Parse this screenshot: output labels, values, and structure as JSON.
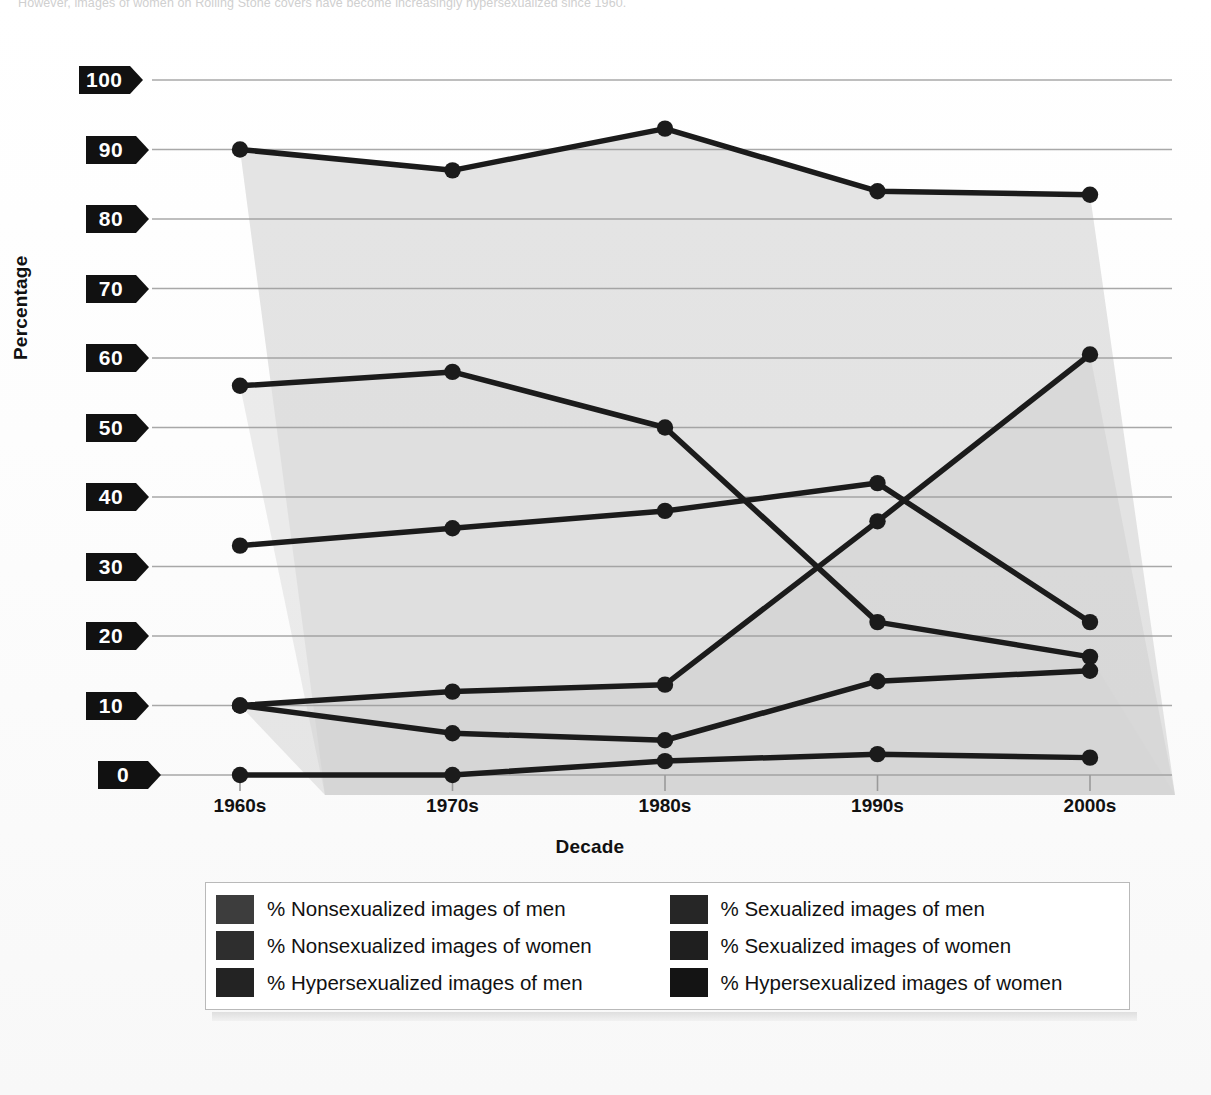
{
  "caption": {
    "text": "However, images of women on Rolling Stone covers have become increasingly hypersexualized since 1960."
  },
  "axis": {
    "ylabel": "Percentage",
    "xlabel": "Decade",
    "yticks": [
      "0",
      "10",
      "20",
      "30",
      "40",
      "50",
      "60",
      "70",
      "80",
      "90",
      "100"
    ],
    "xticks": [
      "1960s",
      "1970s",
      "1980s",
      "1990s",
      "2000s"
    ]
  },
  "colors": {
    "line": "#1b1b1b",
    "marker": "#1b1b1b",
    "grid": "#9a9a9a",
    "tag_bg": "#111111",
    "tag_text": "#ffffff",
    "band_light": "#dcdcdc",
    "band_dark": "#cdcdcd",
    "legend_border": "#b9b9b9",
    "swatch_1": "#3d3d3d",
    "swatch_2": "#2e2e2e",
    "swatch_3": "#232323",
    "swatch_4": "#262626",
    "swatch_5": "#1f1f1f",
    "swatch_6": "#141414"
  },
  "legend": {
    "items": [
      {
        "label": "% Nonsexualized images of men",
        "swatch": "swatch_1",
        "name": "legend-nonsexualized-men"
      },
      {
        "label": "% Sexualized images of men",
        "swatch": "swatch_4",
        "name": "legend-sexualized-men"
      },
      {
        "label": "% Nonsexualized images of women",
        "swatch": "swatch_2",
        "name": "legend-nonsexualized-women"
      },
      {
        "label": "% Sexualized images of women",
        "swatch": "swatch_5",
        "name": "legend-sexualized-women"
      },
      {
        "label": "% Hypersexualized images of men",
        "swatch": "swatch_3",
        "name": "legend-hypersexualized-men"
      },
      {
        "label": "% Hypersexualized images of women",
        "swatch": "swatch_6",
        "name": "legend-hypersexualized-women"
      }
    ]
  },
  "chart_data": {
    "type": "line",
    "title": "",
    "xlabel": "Decade",
    "ylabel": "Percentage",
    "categories": [
      "1960s",
      "1970s",
      "1980s",
      "1990s",
      "2000s"
    ],
    "ylim": [
      0,
      100
    ],
    "ytick_step": 10,
    "grid": true,
    "legend_position": "bottom",
    "markers": "filled-circle",
    "series": [
      {
        "name": "% Nonsexualized images of men",
        "values": [
          90,
          87,
          93,
          84,
          83.5
        ]
      },
      {
        "name": "% Nonsexualized images of women",
        "values": [
          56,
          58,
          50,
          22,
          17
        ]
      },
      {
        "name": "% Sexualized images of men",
        "values": [
          10,
          6,
          5,
          13.5,
          15
        ]
      },
      {
        "name": "% Sexualized images of women",
        "values": [
          33,
          35.5,
          38,
          42,
          22
        ]
      },
      {
        "name": "% Hypersexualized images of men",
        "values": [
          0,
          0,
          2,
          3,
          2.5
        ]
      },
      {
        "name": "% Hypersexualized images of women",
        "values": [
          10,
          12,
          13,
          36.5,
          60.5
        ]
      }
    ]
  }
}
